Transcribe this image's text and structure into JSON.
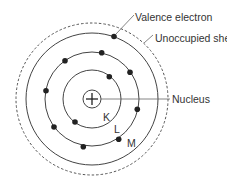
{
  "diagram": {
    "labels": {
      "valence_electron": "Valence electron",
      "unoccupied_shell": "Unoccupied shell",
      "nucleus": "Nucleus",
      "shell_k": "K",
      "shell_l": "L",
      "shell_m": "M"
    },
    "nucleus_symbol": "+",
    "shells": [
      {
        "name": "K",
        "electrons": 2
      },
      {
        "name": "L",
        "electrons": 8
      },
      {
        "name": "M",
        "electrons": 1
      },
      {
        "name": "Unoccupied",
        "electrons": 0,
        "style": "dashed"
      }
    ],
    "colors": {
      "line": "#444444",
      "electron": "#222222",
      "text": "#333333",
      "background": "#ffffff"
    }
  }
}
